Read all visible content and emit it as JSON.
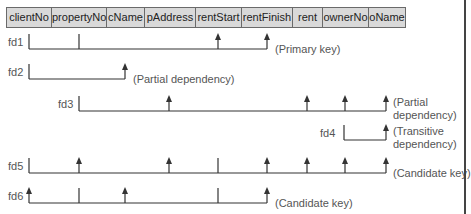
{
  "relation": {
    "attributes": [
      {
        "name": "clientNo",
        "width": 45
      },
      {
        "name": "propertyNo",
        "width": 55
      },
      {
        "name": "cName",
        "width": 38
      },
      {
        "name": "pAddress",
        "width": 51
      },
      {
        "name": "rentStart",
        "width": 46
      },
      {
        "name": "rentFinish",
        "width": 51
      },
      {
        "name": "rent",
        "width": 30
      },
      {
        "name": "ownerNo",
        "width": 46
      },
      {
        "name": "oName",
        "width": 36
      }
    ]
  },
  "colors": {
    "header_fill": "#d9d9d9",
    "line": "#333333",
    "label_text": "#555555"
  },
  "dependencies": [
    {
      "id": "fd1",
      "label": "fd1",
      "note": "(Primary key)",
      "y": 49,
      "x_start": 29,
      "x_end": 267,
      "ticks": [
        29,
        79
      ],
      "arrows": [
        218,
        267
      ],
      "label_x": 8,
      "note_x": 275,
      "note_y": 43
    },
    {
      "id": "fd2",
      "label": "fd2",
      "note": "(Partial dependency)",
      "y": 79,
      "x_start": 29,
      "x_end": 125,
      "ticks": [
        29
      ],
      "arrows": [
        125
      ],
      "label_x": 8,
      "note_x": 133,
      "note_y": 73
    },
    {
      "id": "fd3",
      "label": "fd3",
      "note": "(Partial dependency)",
      "note_lines": [
        "(Partial",
        "dependency)"
      ],
      "y": 111,
      "x_start": 79,
      "x_end": 386,
      "ticks": [
        79
      ],
      "arrows": [
        169,
        307,
        345,
        386
      ],
      "label_x": 58,
      "note_x": 393,
      "note_y": 96
    },
    {
      "id": "fd4",
      "label": "fd4",
      "note": "(Transitive dependency)",
      "note_lines": [
        "(Transitive",
        "dependency)"
      ],
      "y": 140,
      "x_start": 344,
      "x_end": 386,
      "ticks": [
        344
      ],
      "arrows": [
        386
      ],
      "label_x": 320,
      "note_x": 393,
      "note_y": 125
    },
    {
      "id": "fd5",
      "label": "fd5",
      "note": "(Candidate key)",
      "y": 173,
      "x_start": 29,
      "x_end": 386,
      "ticks": [
        29,
        218
      ],
      "arrows": [
        79,
        169,
        267,
        307,
        345,
        386
      ],
      "label_x": 8,
      "note_x": 393,
      "note_y": 167
    },
    {
      "id": "fd6",
      "label": "fd6",
      "note": "(Candidate key)",
      "y": 203,
      "x_start": 29,
      "x_end": 267,
      "ticks": [
        79,
        218
      ],
      "arrows": [
        29,
        125,
        267
      ],
      "label_x": 8,
      "note_x": 275,
      "note_y": 197
    }
  ]
}
